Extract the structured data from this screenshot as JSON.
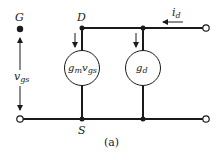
{
  "diagram": {
    "type": "small-signal equivalent circuit (MOSFET)",
    "caption": "(a)",
    "nodes": {
      "gate": "G",
      "drain": "D",
      "source": "S"
    },
    "labels": {
      "vgs_main": "v",
      "vgs_sub": "gs",
      "id_main": "i",
      "id_sub": "d",
      "gm_main": "g",
      "gm_sub1": "m",
      "gm_mid": "v",
      "gm_sub2": "gs",
      "gd_main": "g",
      "gd_sub": "d"
    },
    "elements": [
      {
        "name": "dependent current source",
        "label": "g_m v_gs",
        "between": [
          "D",
          "S"
        ]
      },
      {
        "name": "output conductance",
        "label": "g_d",
        "between": [
          "D",
          "S"
        ]
      }
    ],
    "colors": {
      "line": "#1a1a1a",
      "background": "#ffffff"
    }
  }
}
